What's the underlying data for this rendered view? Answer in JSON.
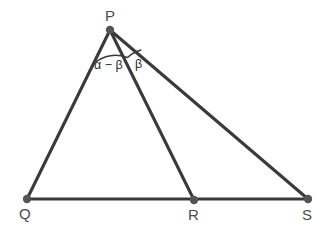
{
  "figure": {
    "background_color": "#ffffff",
    "stroke_color": "#3a3a3a",
    "vertex_dot_color": "#555555",
    "label_color": "#4a4a4a",
    "angle_label_color": "#2e2e2e"
  },
  "vertices": [
    {
      "name": "P",
      "label": "P",
      "x": 110,
      "y": 30,
      "label_x": 105,
      "label_y": 8
    },
    {
      "name": "Q",
      "label": "Q",
      "x": 27,
      "y": 199,
      "label_x": 19,
      "label_y": 206
    },
    {
      "name": "R",
      "label": "R",
      "x": 194,
      "y": 200,
      "label_x": 188,
      "label_y": 207
    },
    {
      "name": "S",
      "label": "S",
      "x": 308,
      "y": 199,
      "label_x": 302,
      "label_y": 207
    }
  ],
  "edges": [
    {
      "name": "segment-PQ",
      "from": "P",
      "to": "Q",
      "x1": 110,
      "y1": 30,
      "x2": 27,
      "y2": 199
    },
    {
      "name": "segment-PR",
      "from": "P",
      "to": "R",
      "x1": 110,
      "y1": 30,
      "x2": 194,
      "y2": 200
    },
    {
      "name": "segment-PS",
      "from": "P",
      "to": "S",
      "x1": 110,
      "y1": 30,
      "x2": 308,
      "y2": 199
    },
    {
      "name": "segment-QS",
      "from": "Q",
      "to": "S",
      "x1": 27,
      "y1": 199,
      "x2": 308,
      "y2": 199
    }
  ],
  "angles": [
    {
      "name": "angle-QPR",
      "label": "α − β",
      "vertex": "P",
      "between": [
        "PQ",
        "PR"
      ],
      "label_x": 94,
      "label_y": 59,
      "arc_path": "M 96.5 61.5 A 34 34 0 0 1 127.5 57.5"
    },
    {
      "name": "angle-RPS",
      "label": "β",
      "vertex": "P",
      "between": [
        "PR",
        "PS"
      ],
      "label_x": 135,
      "label_y": 58,
      "arc_path": "M 128.2 57.0 A 30 30 0 0 1 140.8 50.0"
    }
  ]
}
